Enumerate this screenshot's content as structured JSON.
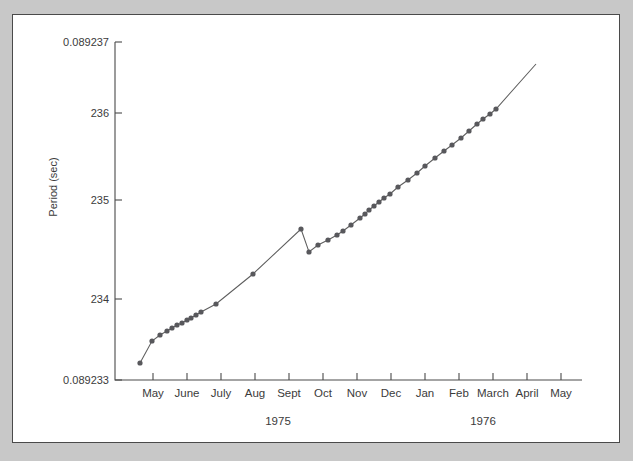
{
  "chart_data": {
    "type": "line",
    "title": "",
    "xlabel": "Time (months)",
    "ylabel": "Period (sec)",
    "grid": false,
    "legend": "none",
    "y_axis": {
      "tick_labels": [
        "0.089237",
        "236",
        "235",
        "234",
        "0.089233"
      ],
      "tick_values": [
        0.089237,
        0.089236,
        0.089235,
        0.089234,
        0.089233
      ],
      "ylim": [
        0.089233,
        0.089237
      ],
      "note": "Inner ticks abbreviate the trailing digits of the period in seconds"
    },
    "x_axis": {
      "tick_labels": [
        "May",
        "June",
        "July",
        "Aug",
        "Sept",
        "Oct",
        "Nov",
        "Dec",
        "Jan",
        "Feb",
        "March",
        "April",
        "May"
      ],
      "year_labels": [
        "1975",
        "1976"
      ],
      "xlim": [
        1975.25,
        1976.45
      ]
    },
    "series": [
      {
        "name": "Pulsar period",
        "x": [
          1975.3,
          1975.36,
          1975.39,
          1975.42,
          1975.44,
          1975.46,
          1975.47,
          1975.485,
          1975.5,
          1975.515,
          1975.525,
          1975.58,
          1975.645,
          1975.715,
          1975.73,
          1975.745,
          1975.762,
          1975.775,
          1975.79,
          1975.81,
          1975.835,
          1975.855,
          1975.875,
          1975.895,
          1975.915,
          1975.93,
          1975.945,
          1975.965,
          1975.985,
          1976.005,
          1976.03,
          1976.055,
          1976.08,
          1976.1,
          1976.125,
          1976.15,
          1976.175,
          1976.195,
          1976.215,
          1976.235
        ],
        "y": [
          0.0892338,
          0.0892343,
          0.0892346,
          0.0892348,
          0.0892349,
          0.089235,
          0.0892351,
          0.0892352,
          0.0892352,
          0.0892353,
          0.0892354,
          0.0892356,
          0.0892361,
          0.0892368,
          0.0892362,
          0.0892363,
          0.0892364,
          0.0892365,
          0.0892366,
          0.0892367,
          0.0892369,
          0.089237,
          0.0892371,
          0.0892372,
          0.0892373,
          0.0892374,
          0.0892375,
          0.0892377,
          0.0892378,
          0.089238,
          0.0892381,
          0.0892383,
          0.0892384,
          0.0892385,
          0.0892386,
          0.0892387,
          0.0892388,
          0.0892389,
          0.089239,
          0.0892391
        ],
        "annotation": "Period increases steadily with a sharp glitch (sudden decrease) near Sept/Oct 1975"
      }
    ],
    "pixel_geometry": {
      "note": "Plot-space pixel coordinates used to reproduce the curve faithfully",
      "axis_left_x": 103,
      "axis_bottom_y": 366,
      "axis_right_x": 570,
      "axis_top_y": 28,
      "y_tick_pixels": [
        28,
        99,
        186,
        285,
        366
      ],
      "x_tick_pixels": [
        141,
        175,
        209,
        243,
        277,
        311,
        345,
        379,
        413,
        447,
        481,
        515,
        549
      ],
      "year_label_pixels": [
        266,
        471
      ],
      "line_path_points": [
        [
          128,
          349
        ],
        [
          140,
          327
        ],
        [
          148,
          321
        ],
        [
          155,
          317
        ],
        [
          160,
          314
        ],
        [
          165,
          311
        ],
        [
          170,
          309
        ],
        [
          175,
          306
        ],
        [
          179,
          304
        ],
        [
          184,
          301
        ],
        [
          189,
          298
        ],
        [
          204,
          290
        ],
        [
          241,
          260
        ],
        [
          289,
          215
        ],
        [
          297,
          238
        ],
        [
          306,
          231
        ],
        [
          316,
          226
        ],
        [
          325,
          221
        ],
        [
          331,
          217
        ],
        [
          339,
          211
        ],
        [
          348,
          204
        ],
        [
          353,
          200
        ],
        [
          357,
          196
        ],
        [
          362,
          192
        ],
        [
          367,
          188
        ],
        [
          372,
          184
        ],
        [
          378,
          180
        ],
        [
          386,
          173
        ],
        [
          396,
          166
        ],
        [
          405,
          159
        ],
        [
          413,
          152
        ],
        [
          423,
          144
        ],
        [
          432,
          137
        ],
        [
          440,
          131
        ],
        [
          449,
          124
        ],
        [
          457,
          117
        ],
        [
          465,
          110
        ],
        [
          471,
          105
        ],
        [
          478,
          100
        ],
        [
          484,
          95
        ],
        [
          524,
          50
        ]
      ],
      "marker_points": [
        [
          128,
          349
        ],
        [
          140,
          327
        ],
        [
          148,
          321
        ],
        [
          155,
          317
        ],
        [
          160,
          314
        ],
        [
          165,
          311
        ],
        [
          170,
          309
        ],
        [
          175,
          306
        ],
        [
          179,
          304
        ],
        [
          184,
          301
        ],
        [
          189,
          298
        ],
        [
          204,
          290
        ],
        [
          241,
          260
        ],
        [
          289,
          215
        ],
        [
          297,
          238
        ],
        [
          306,
          231
        ],
        [
          316,
          226
        ],
        [
          325,
          221
        ],
        [
          331,
          217
        ],
        [
          339,
          211
        ],
        [
          348,
          204
        ],
        [
          353,
          200
        ],
        [
          357,
          196
        ],
        [
          362,
          192
        ],
        [
          367,
          188
        ],
        [
          372,
          184
        ],
        [
          378,
          180
        ],
        [
          386,
          173
        ],
        [
          396,
          166
        ],
        [
          405,
          159
        ],
        [
          413,
          152
        ],
        [
          423,
          144
        ],
        [
          432,
          137
        ],
        [
          440,
          131
        ],
        [
          449,
          124
        ],
        [
          457,
          117
        ],
        [
          465,
          110
        ],
        [
          471,
          105
        ],
        [
          478,
          100
        ],
        [
          484,
          95
        ]
      ],
      "marker_radius": 2.6
    }
  }
}
